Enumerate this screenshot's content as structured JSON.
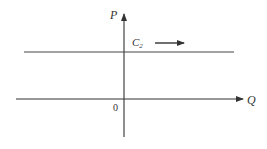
{
  "diagram": {
    "type": "supply-curve-shift",
    "axes": {
      "y_label": "P",
      "x_label": "Q",
      "origin_label": "0"
    },
    "curve": {
      "label_main": "C",
      "label_sub": "2",
      "orientation": "horizontal"
    },
    "shift_arrow": {
      "direction": "right"
    },
    "colors": {
      "line": "#333333",
      "background": "#ffffff"
    }
  }
}
